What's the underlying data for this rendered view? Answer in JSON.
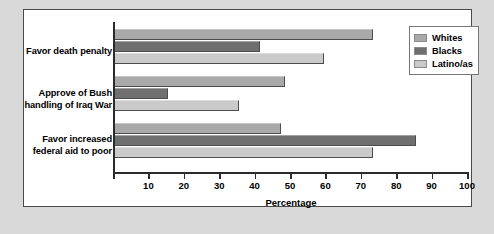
{
  "chart_data": {
    "type": "bar",
    "orientation": "horizontal",
    "title": "",
    "xlabel": "Percentage",
    "ylabel": "",
    "xlim": [
      0,
      100
    ],
    "xticks": [
      0,
      10,
      20,
      30,
      40,
      50,
      60,
      70,
      80,
      90,
      100
    ],
    "xtick_labels": [
      "",
      "10",
      "20",
      "30",
      "40",
      "50",
      "60",
      "70",
      "80",
      "90",
      "100"
    ],
    "grid": false,
    "legend_position": "top-right",
    "categories": [
      "Favor death penalty",
      "Approve of Bush handling of Iraq War",
      "Favor increased federal aid to poor"
    ],
    "category_lines": [
      [
        "Favor death penalty"
      ],
      [
        "Approve of Bush",
        "handling of Iraq War"
      ],
      [
        "Favor increased",
        "federal aid to poor"
      ]
    ],
    "series": [
      {
        "name": "Whites",
        "color": "#a9a9a9",
        "values": [
          73,
          48,
          47
        ]
      },
      {
        "name": "Blacks",
        "color": "#6f6f6f",
        "values": [
          41,
          15,
          85
        ]
      },
      {
        "name": "Latino/as",
        "color": "#cacaca",
        "values": [
          59,
          35,
          73
        ]
      }
    ]
  },
  "caption": "",
  "colors": {
    "panel_background": "#ffffff",
    "figure_background": "#d9d9d9",
    "axis": "#2b2b2b",
    "text": "#000000"
  }
}
